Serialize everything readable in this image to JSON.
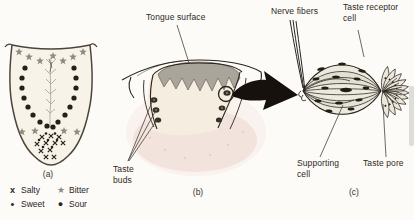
{
  "figure": {
    "panels": {
      "a": {
        "caption": "(a)"
      },
      "b": {
        "caption": "(b)"
      },
      "c": {
        "caption": "(c)"
      }
    },
    "labels": {
      "tongue_surface": "Tongue surface",
      "taste_buds": "Taste buds",
      "nerve_fibers": "Nerve fibers",
      "taste_receptor_cell": "Taste receptor cell",
      "supporting_cell": "Supporting cell",
      "taste_pore": "Taste pore"
    },
    "legend": {
      "items": [
        {
          "symbol": "x",
          "label": "Salty"
        },
        {
          "symbol": "★",
          "label": "Bitter"
        },
        {
          "symbol": "•",
          "label": "Sweet"
        },
        {
          "symbol": "●",
          "label": "Sour"
        }
      ]
    },
    "colors": {
      "ink": "#2b241e",
      "gray_band": "#a9a59a",
      "tissue_pink": "#f3e3dd",
      "cell_fill": "#eae7db",
      "tongue_fill": "#f8f3e9",
      "symbol_gray": "#8f8b7d"
    }
  }
}
